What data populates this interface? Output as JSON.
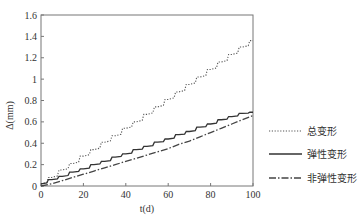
{
  "chart_data": {
    "type": "line",
    "title": "",
    "xlabel": "t(d)",
    "ylabel": "Δ(mm)",
    "xlim": [
      0,
      100
    ],
    "ylim": [
      0,
      1.6
    ],
    "xticks": [
      0,
      20,
      40,
      60,
      80,
      100
    ],
    "yticks": [
      0,
      0.2,
      0.4,
      0.6,
      0.8,
      1,
      1.2,
      1.4,
      1.6
    ],
    "ytick_labels": [
      "0",
      "0.2",
      "0.4",
      "0.6",
      "0.8",
      "1",
      "1.2",
      "1.4",
      "1.6"
    ],
    "grid": false,
    "legend_position": "right",
    "x": [
      0,
      5,
      10,
      15,
      20,
      25,
      30,
      35,
      40,
      45,
      50,
      55,
      60,
      65,
      70,
      75,
      80,
      85,
      90,
      95,
      100
    ],
    "series": [
      {
        "name": "总变形",
        "style": "dotted",
        "values": [
          0.02,
          0.08,
          0.15,
          0.21,
          0.28,
          0.34,
          0.41,
          0.47,
          0.54,
          0.6,
          0.67,
          0.74,
          0.81,
          0.88,
          0.95,
          1.02,
          1.09,
          1.16,
          1.23,
          1.3,
          1.36
        ]
      },
      {
        "name": "弹性变形",
        "style": "solid",
        "values": [
          0.02,
          0.06,
          0.09,
          0.13,
          0.16,
          0.2,
          0.23,
          0.27,
          0.3,
          0.34,
          0.37,
          0.41,
          0.44,
          0.48,
          0.51,
          0.55,
          0.58,
          0.62,
          0.65,
          0.68,
          0.69
        ]
      },
      {
        "name": "非弹性变形",
        "style": "dashdot",
        "values": [
          0.0,
          0.02,
          0.05,
          0.08,
          0.11,
          0.14,
          0.17,
          0.2,
          0.23,
          0.26,
          0.29,
          0.32,
          0.35,
          0.39,
          0.42,
          0.46,
          0.5,
          0.54,
          0.58,
          0.62,
          0.66
        ]
      }
    ]
  },
  "legend": {
    "items": [
      "总变形",
      "弹性变形",
      "非弹性变形"
    ]
  },
  "axes": {
    "xlabel": "t(d)",
    "ylabel": "Δ(mm)"
  }
}
